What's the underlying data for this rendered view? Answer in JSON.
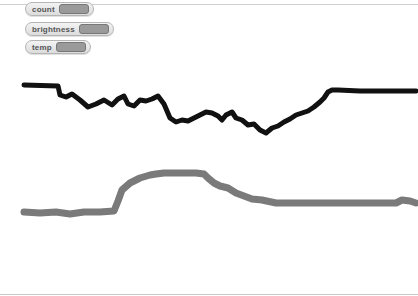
{
  "stage": {
    "watchers": [
      {
        "label": "count",
        "value": ""
      },
      {
        "label": "brightness",
        "value": ""
      },
      {
        "label": "temp",
        "value": ""
      }
    ]
  },
  "colors": {
    "temp_trace": "#111111",
    "brightness_trace": "#7a7a7a",
    "watcher_value_bg": "#9a9a9a"
  },
  "traces": {
    "dark_line_points": "24,85 58,86 60,95 66,97 72,94 80,100 88,107 96,104 104,100 112,105 118,99 124,96 128,104 134,106 140,100 146,101 152,99 158,96 164,104 170,118 176,122 182,120 188,121 194,118 200,115 206,112 212,113 218,116 222,120 226,115 232,112 236,118 242,120 248,125 254,124 260,130 266,133 272,128 278,126 284,122 290,119 296,115 302,113 308,111 314,107 320,102 324,98 328,92 332,90 338,90 360,91 380,91 398,91 416,91",
    "gray_line_points": "24,212 40,213 56,212 70,214 84,212 100,212 114,211 118,201 122,190 130,183 140,178 150,175 156,174 164,173 180,173 196,173 204,174 208,178 214,183 220,186 228,188 236,193 244,196 252,199 262,200 276,203 300,203 330,203 360,203 380,203 396,203 402,200 410,201 416,203"
  }
}
